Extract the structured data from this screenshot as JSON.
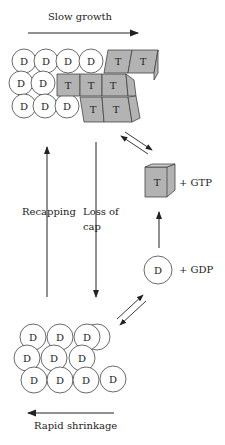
{
  "labels": {
    "slow_growth": "Slow growth",
    "rapid_shrinkage": "Rapid shrinkage",
    "recapping": "Recapping",
    "loss_of_cap_line1": "Loss of",
    "loss_of_cap_line2": "cap",
    "gtp": "+ GTP",
    "gdp": "+ GDP",
    "t_subunit": "T",
    "d_subunit": "D"
  },
  "colors": {
    "gtp_subunit_fill": "#b3b3b3",
    "outline": "#333333"
  }
}
